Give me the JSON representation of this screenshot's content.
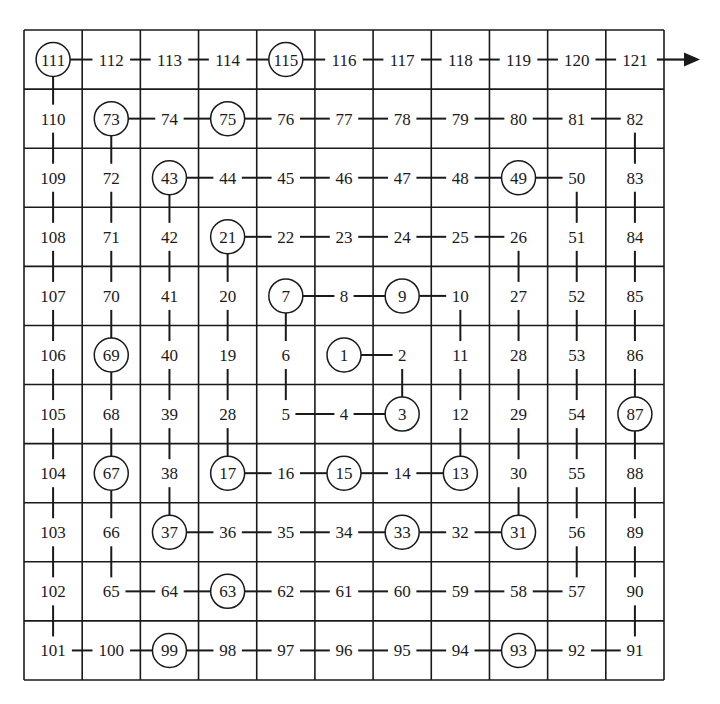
{
  "diagram": {
    "type": "ulam-spiral-grid",
    "rows": 11,
    "cols": 11,
    "grid": {
      "left": 24,
      "top": 30,
      "width": 640,
      "height": 650,
      "line_color": "#1a1a1a",
      "text_color": "#1a1a1a"
    },
    "labels": [
      [
        "111",
        "112",
        "113",
        "114",
        "115",
        "116",
        "117",
        "118",
        "119",
        "120",
        "121"
      ],
      [
        "110",
        "73",
        "74",
        "75",
        "76",
        "77",
        "78",
        "79",
        "80",
        "81",
        "82"
      ],
      [
        "109",
        "72",
        "43",
        "44",
        "45",
        "46",
        "47",
        "48",
        "49",
        "50",
        "83"
      ],
      [
        "108",
        "71",
        "42",
        "21",
        "22",
        "23",
        "24",
        "25",
        "26",
        "51",
        "84"
      ],
      [
        "107",
        "70",
        "41",
        "20",
        "7",
        "8",
        "9",
        "10",
        "27",
        "52",
        "85"
      ],
      [
        "106",
        "69",
        "40",
        "19",
        "6",
        "1",
        "2",
        "11",
        "28",
        "53",
        "86"
      ],
      [
        "105",
        "68",
        "39",
        "28",
        "5",
        "4",
        "3",
        "12",
        "29",
        "54",
        "87"
      ],
      [
        "104",
        "67",
        "38",
        "17",
        "16",
        "15",
        "14",
        "13",
        "30",
        "55",
        "88"
      ],
      [
        "103",
        "66",
        "37",
        "36",
        "35",
        "34",
        "33",
        "32",
        "31",
        "56",
        "89"
      ],
      [
        "102",
        "65",
        "64",
        "63",
        "62",
        "61",
        "60",
        "59",
        "58",
        "57",
        "90"
      ],
      [
        "101",
        "100",
        "99",
        "98",
        "97",
        "96",
        "95",
        "94",
        "93",
        "92",
        "91"
      ]
    ],
    "circled": [
      [
        0,
        0
      ],
      [
        0,
        4
      ],
      [
        1,
        1
      ],
      [
        1,
        3
      ],
      [
        2,
        2
      ],
      [
        2,
        8
      ],
      [
        3,
        3
      ],
      [
        4,
        4
      ],
      [
        4,
        6
      ],
      [
        5,
        1
      ],
      [
        5,
        5
      ],
      [
        6,
        6
      ],
      [
        6,
        10
      ],
      [
        7,
        1
      ],
      [
        7,
        3
      ],
      [
        7,
        5
      ],
      [
        7,
        7
      ],
      [
        8,
        2
      ],
      [
        8,
        6
      ],
      [
        8,
        8
      ],
      [
        9,
        3
      ],
      [
        10,
        2
      ],
      [
        10,
        8
      ]
    ],
    "spiral_start": [
      5,
      5
    ],
    "spiral_length": 121,
    "exit_arrow": {
      "from_cell": [
        0,
        10
      ],
      "direction": "right",
      "icon": "arrow-right-icon"
    }
  }
}
